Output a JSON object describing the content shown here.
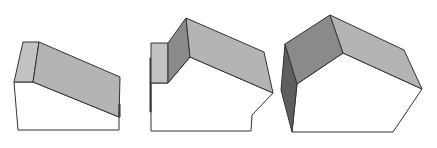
{
  "diagram": {
    "colors": {
      "background": "#ffffff",
      "edge": "#333333",
      "face_white": "#ffffff",
      "face_light": "#c2c2c2",
      "face_mid": "#b4b4b4",
      "face_dark": "#8a8a8a",
      "face_darkest": "#5e5e5e"
    },
    "shapes": [
      {
        "id": "shape-1",
        "label": "Wedge block with small front step",
        "faces": [
          {
            "name": "front-face",
            "shade": "face_white",
            "points": "14,82 33,82 119,117 119,130 18,130"
          },
          {
            "name": "step-top-face",
            "shade": "face_light",
            "points": "14,82 23,42 39,42 33,82"
          },
          {
            "name": "slope-face",
            "shade": "face_mid",
            "points": "33,82 39,42 120,77 119,117"
          },
          {
            "name": "right-edge-face",
            "shade": "face_darkest",
            "points": "119,104 120,104 120,117 119,117"
          }
        ]
      },
      {
        "id": "shape-2",
        "label": "Block with step, dark bevel and slope",
        "faces": [
          {
            "name": "front-face",
            "shade": "face_white",
            "points": "151,83 168,83 190,57 273,93 252,115 251,131 151,131"
          },
          {
            "name": "left-edge-face",
            "shade": "face_darkest",
            "points": "150,58 151,58 151,112 150,112"
          },
          {
            "name": "step-face",
            "shade": "face_light",
            "points": "151,43 168,43 168,83 151,83"
          },
          {
            "name": "bevel-face",
            "shade": "face_dark",
            "points": "168,83 168,43 186,18 190,57"
          },
          {
            "name": "slope-face",
            "shade": "face_mid",
            "points": "186,18 190,57 273,93 264,52"
          }
        ]
      },
      {
        "id": "shape-3",
        "label": "Pentagonal prism-like block",
        "faces": [
          {
            "name": "front-face",
            "shade": "face_white",
            "points": "297,84 343,53 422,89 393,132 292,132"
          },
          {
            "name": "left-face",
            "shade": "face_darkest",
            "points": "285,44 297,84 292,132 281,90"
          },
          {
            "name": "top-left-face",
            "shade": "face_dark",
            "points": "285,44 330,15 343,53 297,84"
          },
          {
            "name": "top-right-face",
            "shade": "face_mid",
            "points": "330,15 343,53 422,89 404,50"
          }
        ]
      }
    ]
  }
}
